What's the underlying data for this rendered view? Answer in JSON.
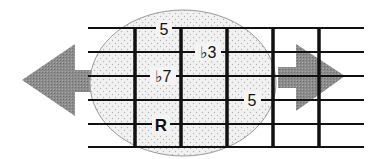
{
  "diagram": {
    "type": "guitar-fretboard",
    "strings": 6,
    "frets_visible": 5,
    "highlight_shape": "ellipse",
    "colors": {
      "lines": "#111111",
      "arrow": "#8a8a8a",
      "ellipse_fill": "#eeeeee",
      "ellipse_stroke": "#999999",
      "text": "#111111"
    },
    "arrows": [
      {
        "direction": "left",
        "name": "shift-left"
      },
      {
        "direction": "right",
        "name": "shift-right"
      }
    ],
    "notes": [
      {
        "label": "5",
        "string": 1,
        "position": "between fret 1 and 2"
      },
      {
        "label": "♭3",
        "string": 2,
        "position": "between fret 2 and 3"
      },
      {
        "label": "♭7",
        "string": 3,
        "position": "between fret 1 and 2"
      },
      {
        "label": "5",
        "string": 4,
        "position": "between fret 3 and 4"
      },
      {
        "label": "R",
        "string": 5,
        "position": "between fret 1 and 2",
        "bold": true
      }
    ]
  }
}
